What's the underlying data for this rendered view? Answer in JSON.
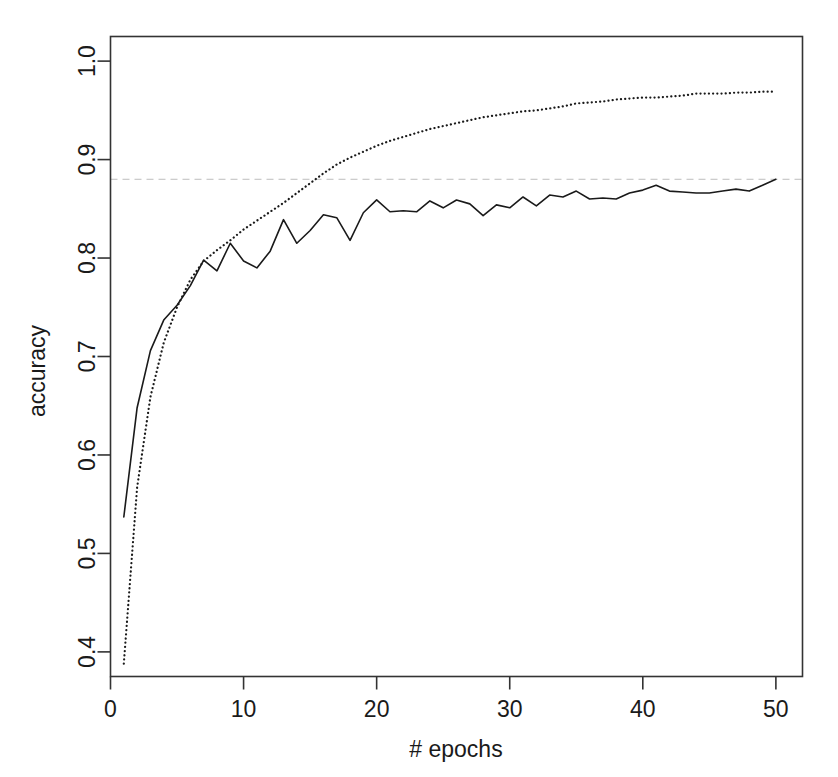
{
  "figure": {
    "background_color": "#ffffff",
    "frame_color": "#333333",
    "width": 838,
    "height": 777
  },
  "axes": {
    "x_title": "# epochs",
    "y_title": "accuracy",
    "x_ticks": [
      "0",
      "10",
      "20",
      "30",
      "40",
      "50"
    ],
    "y_ticks": [
      "0.4",
      "0.5",
      "0.6",
      "0.7",
      "0.8",
      "0.9",
      "1.0"
    ]
  },
  "chart_data": {
    "type": "line",
    "title": "",
    "xlabel": "# epochs",
    "ylabel": "accuracy",
    "xlim": [
      0.0,
      52.0
    ],
    "ylim": [
      0.375,
      1.025
    ],
    "xticks": [
      0,
      10,
      20,
      30,
      40,
      50
    ],
    "yticks": [
      0.4,
      0.5,
      0.6,
      0.7,
      0.8,
      0.9,
      1.0
    ],
    "grid": false,
    "legend": null,
    "x": [
      1,
      2,
      3,
      4,
      5,
      6,
      7,
      8,
      9,
      10,
      11,
      12,
      13,
      14,
      15,
      16,
      17,
      18,
      19,
      20,
      21,
      22,
      23,
      24,
      25,
      26,
      27,
      28,
      29,
      30,
      31,
      32,
      33,
      34,
      35,
      36,
      37,
      38,
      39,
      40,
      41,
      42,
      43,
      44,
      45,
      46,
      47,
      48,
      49,
      50
    ],
    "series": [
      {
        "name": "validation accuracy",
        "style": "solid",
        "color": "#1a1a1a",
        "linewidth": 1.6,
        "values": [
          0.537,
          0.648,
          0.706,
          0.737,
          0.752,
          0.772,
          0.798,
          0.787,
          0.815,
          0.797,
          0.79,
          0.807,
          0.839,
          0.815,
          0.828,
          0.844,
          0.841,
          0.818,
          0.846,
          0.859,
          0.847,
          0.848,
          0.847,
          0.858,
          0.851,
          0.859,
          0.855,
          0.843,
          0.854,
          0.851,
          0.862,
          0.853,
          0.864,
          0.862,
          0.868,
          0.86,
          0.861,
          0.86,
          0.866,
          0.869,
          0.874,
          0.868,
          0.867,
          0.866,
          0.866,
          0.868,
          0.87,
          0.868,
          0.874,
          0.88
        ]
      },
      {
        "name": "training accuracy",
        "style": "dotted",
        "color": "#1a1a1a",
        "linewidth": 1.8,
        "values": [
          0.388,
          0.567,
          0.659,
          0.714,
          0.75,
          0.778,
          0.797,
          0.808,
          0.818,
          0.829,
          0.838,
          0.847,
          0.856,
          0.866,
          0.876,
          0.886,
          0.895,
          0.902,
          0.908,
          0.914,
          0.919,
          0.923,
          0.927,
          0.931,
          0.934,
          0.937,
          0.94,
          0.943,
          0.945,
          0.947,
          0.949,
          0.95,
          0.952,
          0.954,
          0.957,
          0.958,
          0.959,
          0.961,
          0.962,
          0.963,
          0.963,
          0.964,
          0.965,
          0.967,
          0.967,
          0.967,
          0.968,
          0.968,
          0.969,
          0.969
        ]
      }
    ],
    "reference_lines": [
      {
        "name": "best-accuracy-reference",
        "orientation": "horizontal",
        "value": 0.88,
        "style": "dashed",
        "color": "#bdbdbd",
        "linewidth": 1.0
      }
    ]
  }
}
